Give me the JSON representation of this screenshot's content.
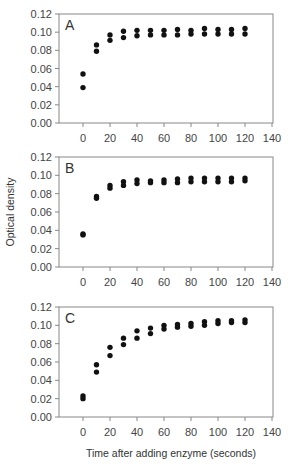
{
  "chart_data": [
    {
      "type": "scatter",
      "panel": "A",
      "xlabel": "",
      "ylabel": "",
      "xlim": [
        -18,
        140
      ],
      "ylim": [
        0.0,
        0.12
      ],
      "xticks": [
        0,
        20,
        40,
        60,
        80,
        100,
        120,
        140
      ],
      "yticks": [
        "0.00",
        "0.02",
        "0.04",
        "0.06",
        "0.08",
        "0.10",
        "0.12"
      ],
      "grid": false,
      "series": [
        {
          "name": "replicate 1",
          "x": [
            0,
            10,
            20,
            30,
            40,
            50,
            60,
            70,
            80,
            90,
            100,
            110,
            120
          ],
          "y": [
            0.054,
            0.086,
            0.097,
            0.101,
            0.102,
            0.102,
            0.102,
            0.103,
            0.102,
            0.104,
            0.103,
            0.103,
            0.104
          ]
        },
        {
          "name": "replicate 2",
          "x": [
            0,
            10,
            20,
            30,
            40,
            50,
            60,
            70,
            80,
            90,
            100,
            110,
            120
          ],
          "y": [
            0.039,
            0.079,
            0.091,
            0.094,
            0.096,
            0.097,
            0.097,
            0.097,
            0.098,
            0.098,
            0.098,
            0.098,
            0.098
          ]
        }
      ]
    },
    {
      "type": "scatter",
      "panel": "B",
      "xlabel": "",
      "ylabel": "Optical density",
      "xlim": [
        -18,
        140
      ],
      "ylim": [
        0.0,
        0.12
      ],
      "xticks": [
        0,
        20,
        40,
        60,
        80,
        100,
        120,
        140
      ],
      "yticks": [
        "0.00",
        "0.02",
        "0.04",
        "0.06",
        "0.08",
        "0.10",
        "0.12"
      ],
      "grid": false,
      "series": [
        {
          "name": "replicate 1",
          "x": [
            0,
            10,
            20,
            30,
            40,
            50,
            60,
            70,
            80,
            90,
            100,
            110,
            120
          ],
          "y": [
            0.036,
            0.077,
            0.089,
            0.093,
            0.095,
            0.094,
            0.095,
            0.096,
            0.097,
            0.097,
            0.097,
            0.097,
            0.097
          ]
        },
        {
          "name": "replicate 2",
          "x": [
            0,
            10,
            20,
            30,
            40,
            50,
            60,
            70,
            80,
            90,
            100,
            110,
            120
          ],
          "y": [
            0.035,
            0.075,
            0.086,
            0.089,
            0.091,
            0.092,
            0.092,
            0.092,
            0.093,
            0.093,
            0.093,
            0.093,
            0.094
          ]
        }
      ]
    },
    {
      "type": "scatter",
      "panel": "C",
      "xlabel": "Time after adding enzyme (seconds)",
      "ylabel": "",
      "xlim": [
        -18,
        140
      ],
      "ylim": [
        0.0,
        0.12
      ],
      "xticks": [
        0,
        20,
        40,
        60,
        80,
        100,
        120,
        140
      ],
      "yticks": [
        "0.00",
        "0.02",
        "0.04",
        "0.06",
        "0.08",
        "0.10",
        "0.12"
      ],
      "grid": false,
      "series": [
        {
          "name": "replicate 1",
          "x": [
            0,
            10,
            20,
            30,
            40,
            50,
            60,
            70,
            80,
            90,
            100,
            110,
            120
          ],
          "y": [
            0.023,
            0.057,
            0.076,
            0.086,
            0.094,
            0.097,
            0.1,
            0.101,
            0.102,
            0.104,
            0.105,
            0.105,
            0.106
          ]
        },
        {
          "name": "replicate 2",
          "x": [
            0,
            10,
            20,
            30,
            40,
            50,
            60,
            70,
            80,
            90,
            100,
            110,
            120
          ],
          "y": [
            0.02,
            0.049,
            0.067,
            0.079,
            0.086,
            0.091,
            0.096,
            0.098,
            0.099,
            0.1,
            0.102,
            0.103,
            0.103
          ]
        }
      ]
    }
  ],
  "labels": {
    "panel_a": "A",
    "panel_b": "B",
    "panel_c": "C",
    "y_axis_title": "Optical density",
    "x_axis_title": "Time after adding enzyme (seconds)"
  },
  "colors": {
    "marker": "#111111",
    "axis": "#888888"
  }
}
